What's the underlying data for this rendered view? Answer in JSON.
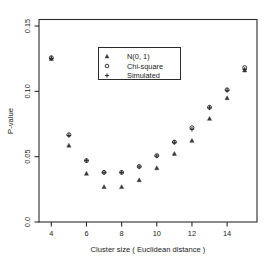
{
  "chart_data": {
    "type": "scatter",
    "title": "",
    "xlabel": "Cluster size  ( Euclidean distance )",
    "ylabel": "P-value",
    "xlim": [
      3.3,
      15.7
    ],
    "ylim": [
      0.0,
      0.155
    ],
    "grid": false,
    "legend_position": "top-center",
    "x_ticks": [
      4,
      6,
      8,
      10,
      12,
      14
    ],
    "x_tick_labels": [
      "4",
      "6",
      "8",
      "10",
      "12",
      "14"
    ],
    "y_ticks": [
      0.0,
      0.05,
      0.1,
      0.15
    ],
    "y_tick_labels": [
      "0.0",
      "0.05",
      "0.10",
      "0.15"
    ],
    "x": [
      4,
      5,
      6,
      7,
      8,
      9,
      10,
      11,
      12,
      13,
      14,
      15
    ],
    "series": [
      {
        "name": "N(0, 1)",
        "marker": "triangle",
        "values": [
          0.1248,
          0.0585,
          0.037,
          0.0268,
          0.0268,
          0.032,
          0.0412,
          0.0522,
          0.0622,
          0.079,
          0.0948,
          0.116
        ]
      },
      {
        "name": "Chi-square",
        "marker": "circle",
        "values": [
          0.1258,
          0.0668,
          0.047,
          0.038,
          0.038,
          0.0425,
          0.0508,
          0.0612,
          0.0722,
          0.0878,
          0.1012,
          0.1182
        ]
      },
      {
        "name": "Simulated",
        "marker": "plus",
        "values": [
          0.1252,
          0.0662,
          0.047,
          0.0378,
          0.0378,
          0.0422,
          0.0505,
          0.061,
          0.071,
          0.0874,
          0.1008,
          0.1168
        ]
      }
    ]
  },
  "legend": {
    "entries": [
      {
        "label": "N(0, 1)",
        "marker": "triangle-icon"
      },
      {
        "label": "Chi-square",
        "marker": "circle-icon"
      },
      {
        "label": "Simulated",
        "marker": "plus-icon"
      }
    ]
  },
  "colors": {
    "axis": "#2b2b2b",
    "marker": "#2a2a2a",
    "background": "#ffffff"
  }
}
